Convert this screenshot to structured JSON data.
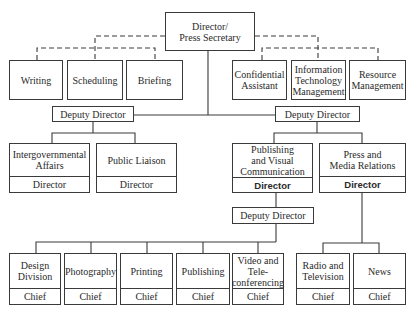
{
  "chart": {
    "top": {
      "label": "Director/\nPress Secretary"
    },
    "staff_left": [
      {
        "label": "Writing"
      },
      {
        "label": "Scheduling"
      },
      {
        "label": "Briefing"
      }
    ],
    "staff_right": [
      {
        "label": "Confidential\nAssistant"
      },
      {
        "label": "Information\nTechnology\nManagement"
      },
      {
        "label": "Resource\nManagement"
      }
    ],
    "deputy_left": {
      "label": "Deputy Director"
    },
    "deputy_right": {
      "label": "Deputy Director"
    },
    "left_units": [
      {
        "label": "Intergovernmental\nAffairs",
        "role": "Director"
      },
      {
        "label": "Public Liaison",
        "role": "Director"
      }
    ],
    "right_units": [
      {
        "label": "Publishing\nand Visual\nCommunication",
        "role": "Director"
      },
      {
        "label": "Press and\nMedia Relations",
        "role": "Director"
      }
    ],
    "deputy_publishing": {
      "label": "Deputy Director"
    },
    "publishing_units": [
      {
        "label": "Design\nDivision",
        "role": "Chief"
      },
      {
        "label": "Photography",
        "role": "Chief"
      },
      {
        "label": "Printing",
        "role": "Chief"
      },
      {
        "label": "Publishing",
        "role": "Chief"
      },
      {
        "label": "Video and\nTele-\nconferencing",
        "role": "Chief"
      }
    ],
    "media_units": [
      {
        "label": "Radio and\nTelevision",
        "role": "Chief"
      },
      {
        "label": "News",
        "role": "Chief"
      }
    ]
  }
}
